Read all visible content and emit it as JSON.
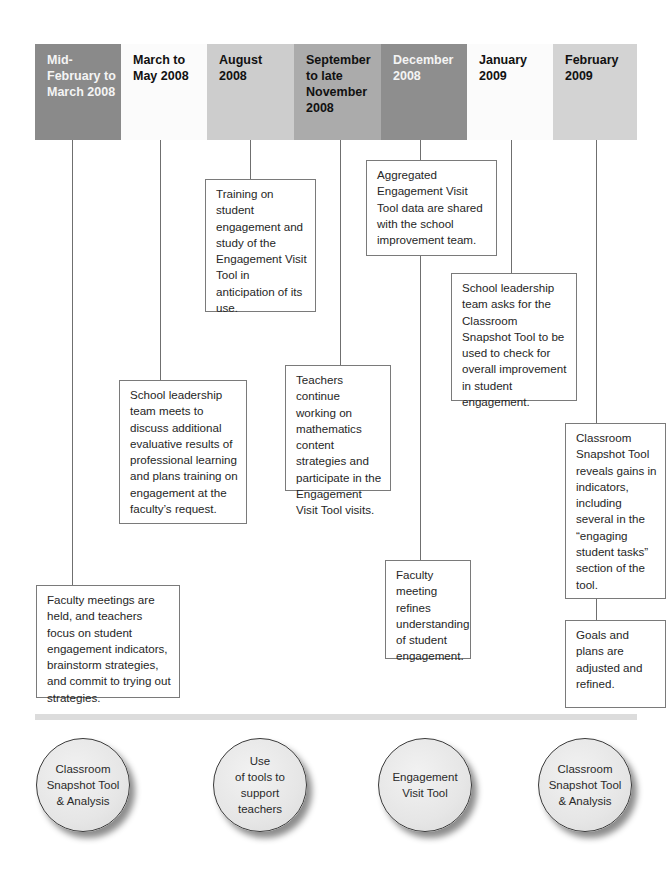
{
  "timeline": {
    "periods": [
      {
        "label": "Mid-\nFebruary to\nMarch 2008",
        "color": "#8a8a8a",
        "text_color": "#f4f4f4"
      },
      {
        "label": "March to\nMay 2008",
        "color": "#fbfbfb",
        "text_color": "#111111"
      },
      {
        "label": "August\n2008",
        "color": "#cdcdcd",
        "text_color": "#111111"
      },
      {
        "label": "September\nto late\nNovember\n2008",
        "color": "#ababab",
        "text_color": "#111111"
      },
      {
        "label": "December\n2008",
        "color": "#8e8e8e",
        "text_color": "#f4f4f4"
      },
      {
        "label": "January\n2009",
        "color": "#fbfbfb",
        "text_color": "#111111"
      },
      {
        "label": "February\n2009",
        "color": "#d3d3d3",
        "text_color": "#111111"
      }
    ]
  },
  "events": {
    "mid_feb_march_2008": "Faculty meetings are held, and teachers focus on student engagement indicators, brainstorm strategies, and commit to trying out strategies.",
    "march_may_2008": "School leadership team meets to discuss additional evaluative results of professional learning and plans training on engagement at the faculty’s request.",
    "august_2008": "Training on student engagement and study of the Engagement Visit Tool in anticipation of its use.",
    "sep_nov_2008": "Teachers continue working on mathematics content strategies and participate in the Engagement Visit Tool visits.",
    "december_2008_a": "Aggregated Engagement Visit Tool data are shared with the school improvement team.",
    "december_2008_b": "Faculty meeting refines understanding of student engagement.",
    "january_2009": "School leadership team asks for the Classroom Snapshot Tool to be used to check for overall improvement in student engagement.",
    "february_2009_a": "Classroom Snapshot Tool reveals gains in indicators, including several in the “engaging student tasks” section of the tool.",
    "february_2009_b": "Goals and plans are adjusted and refined."
  },
  "tools": [
    {
      "label": "Classroom\nSnapshot Tool\n& Analysis"
    },
    {
      "label": "Use\nof tools to\nsupport\nteachers"
    },
    {
      "label": "Engagement\nVisit Tool"
    },
    {
      "label": "Classroom\nSnapshot Tool\n& Analysis"
    }
  ]
}
